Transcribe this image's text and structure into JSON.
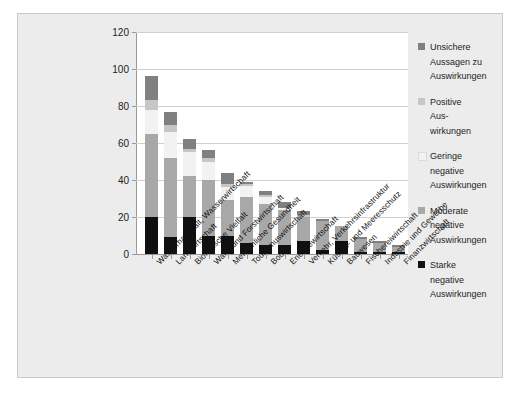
{
  "chart_data": {
    "type": "bar",
    "subtype": "stacked-vertical",
    "title": "",
    "xlabel": "",
    "ylabel": "",
    "ylim": [
      0,
      120
    ],
    "yticks": [
      0,
      20,
      40,
      60,
      80,
      100,
      120
    ],
    "grid": true,
    "legend_position": "right",
    "categories": [
      "Wasserhaushalt, Wasserwirtschaft",
      "Landwirtschaft",
      "Biologische Vielfalt",
      "Wald- und Forstwirtschaft",
      "Menschliche Gesundheit",
      "Tourismuswirtschaft",
      "Boden",
      "Energiewirtschaft",
      "Verkehr, Verkehrsinfrastruktur",
      "Küsten- und Meeresschutz",
      "Bauwesen",
      "Fischereiwirtschaft",
      "Industrie und Gewerbe",
      "Finanzwirtschaft"
    ],
    "series": [
      {
        "name": "Starke negative Auswirkungen",
        "color": "#101010",
        "values": [
          20,
          9,
          20,
          10,
          10,
          6,
          5,
          5,
          7,
          2,
          7,
          1,
          1,
          1
        ]
      },
      {
        "name": "Moderate negative Auswirkungen",
        "color": "#a8a8a8",
        "values": [
          45,
          43,
          22,
          30,
          19,
          25,
          22,
          19,
          13,
          16,
          8,
          7,
          5,
          3
        ]
      },
      {
        "name": "Geringe negative Auswirkungen",
        "color": "#f2f2f2",
        "values": [
          13,
          14,
          13,
          10,
          7,
          6,
          4,
          1,
          0,
          0,
          0,
          0,
          0,
          0
        ]
      },
      {
        "name": "Positive Auswirkungen",
        "color": "#c6c6c6",
        "values": [
          5,
          4,
          2,
          2,
          2,
          1,
          1,
          0,
          1,
          0,
          0,
          0,
          0,
          0
        ]
      },
      {
        "name": "Unsichere Aussagen zu Auswirkungen",
        "color": "#808080",
        "values": [
          13,
          7,
          5,
          4,
          6,
          1,
          2,
          3,
          2,
          1,
          0,
          1,
          1,
          1
        ]
      }
    ],
    "totals": [
      96,
      77,
      62,
      56,
      44,
      39,
      34,
      28,
      23,
      19,
      15,
      9,
      7,
      5
    ]
  },
  "legend": {
    "items": [
      {
        "swatch_color": "#808080",
        "lines": [
          "Unsichere",
          "Aussagen zu",
          "Auswirkungen"
        ]
      },
      {
        "swatch_color": "#c6c6c6",
        "lines": [
          "Positive",
          "Aus-",
          "wirkungen"
        ]
      },
      {
        "swatch_color": "#f2f2f2",
        "lines": [
          "Geringe",
          "negative",
          "Auswirkungen"
        ]
      },
      {
        "swatch_color": "#a8a8a8",
        "lines": [
          "Moderate",
          "negative",
          "Auswirkungen"
        ]
      },
      {
        "swatch_color": "#101010",
        "lines": [
          "Starke",
          "negative",
          "Auswirkungen"
        ]
      }
    ]
  },
  "colors": {
    "panel_background": "#ececec",
    "plot_background": "#ffffff",
    "axis": "#9a9a9a",
    "gridline": "#d0d0d0",
    "text": "#1d1d1d"
  }
}
